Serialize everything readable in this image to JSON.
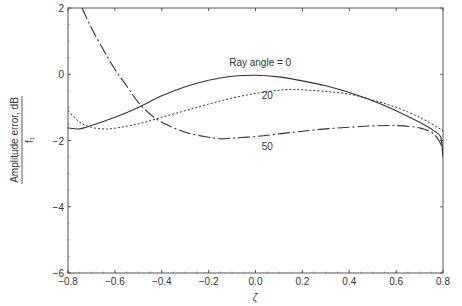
{
  "chart_data": {
    "type": "line",
    "title": "",
    "xlabel": "ζ",
    "ylabel": "Amplitude error, dB",
    "ylabel_denominator": "f₁",
    "xlim": [
      -0.8,
      0.8
    ],
    "ylim": [
      -6,
      2
    ],
    "grid": false,
    "legend": "inline labels",
    "x_ticks": [
      -0.8,
      -0.6,
      -0.4,
      -0.2,
      0.0,
      0.2,
      0.4,
      0.6,
      0.8
    ],
    "x_tick_labels": [
      "−0.8",
      "−0.6",
      "−0.4",
      "−0.2",
      "0.0",
      "0.2",
      "0.4",
      "0.6",
      "0.8"
    ],
    "y_ticks": [
      -6,
      -4,
      -2,
      0,
      2
    ],
    "y_tick_labels": [
      "−6",
      "−4",
      "−2",
      "0",
      "2"
    ],
    "series": [
      {
        "name": "Ray angle = 0",
        "label": "Ray angle = 0",
        "style": "solid",
        "x": [
          -0.8,
          -0.75,
          -0.7,
          -0.6,
          -0.5,
          -0.4,
          -0.3,
          -0.2,
          -0.1,
          0.0,
          0.1,
          0.2,
          0.3,
          0.4,
          0.5,
          0.6,
          0.7,
          0.76,
          0.79,
          0.8
        ],
        "y": [
          -1.62,
          -1.65,
          -1.55,
          -1.3,
          -1.0,
          -0.65,
          -0.38,
          -0.18,
          -0.06,
          -0.03,
          -0.08,
          -0.2,
          -0.35,
          -0.55,
          -0.8,
          -1.1,
          -1.45,
          -1.7,
          -1.9,
          -2.5
        ]
      },
      {
        "name": "20",
        "label": "20",
        "style": "dotted",
        "x": [
          -0.8,
          -0.75,
          -0.7,
          -0.65,
          -0.6,
          -0.5,
          -0.4,
          -0.3,
          -0.2,
          -0.1,
          0.0,
          0.1,
          0.15,
          0.2,
          0.3,
          0.4,
          0.5,
          0.6,
          0.7,
          0.8
        ],
        "y": [
          -1.1,
          -1.45,
          -1.6,
          -1.65,
          -1.63,
          -1.5,
          -1.3,
          -1.1,
          -0.9,
          -0.72,
          -0.58,
          -0.48,
          -0.46,
          -0.47,
          -0.52,
          -0.6,
          -0.78,
          -1.0,
          -1.3,
          -1.7
        ]
      },
      {
        "name": "50",
        "label": "50",
        "style": "dashdot",
        "x": [
          -0.74,
          -0.7,
          -0.65,
          -0.6,
          -0.55,
          -0.5,
          -0.45,
          -0.4,
          -0.3,
          -0.2,
          -0.15,
          -0.1,
          0.0,
          0.1,
          0.2,
          0.3,
          0.4,
          0.5,
          0.6,
          0.7,
          0.76,
          0.79,
          0.8
        ],
        "y": [
          2.0,
          1.4,
          0.75,
          0.15,
          -0.35,
          -0.85,
          -1.2,
          -1.45,
          -1.75,
          -1.9,
          -1.95,
          -1.93,
          -1.88,
          -1.8,
          -1.72,
          -1.65,
          -1.6,
          -1.56,
          -1.55,
          -1.62,
          -1.8,
          -2.1,
          -2.4
        ]
      }
    ],
    "annotations": [
      {
        "text": "Ray angle = 0",
        "x": 0.02,
        "y": 0.25
      },
      {
        "text": "20",
        "x": 0.05,
        "y": -0.75
      },
      {
        "text": "50",
        "x": 0.05,
        "y": -2.3
      }
    ]
  },
  "layout": {
    "plot_left": 68,
    "plot_right": 443,
    "plot_top": 8,
    "plot_bottom": 273,
    "line_color": "#333333",
    "axis_color": "#555555"
  }
}
